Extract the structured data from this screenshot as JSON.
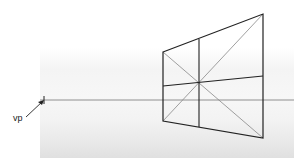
{
  "diagram": {
    "vanishing_point": {
      "label": "vp",
      "x": 44,
      "y": 100
    },
    "horizon_line": {
      "y": 100,
      "x1": 40,
      "x2": 294
    },
    "plane": {
      "top_left": [
        163,
        52
      ],
      "top_right": [
        263,
        14
      ],
      "bottom_right": [
        263,
        138
      ],
      "bottom_left": [
        163,
        121
      ],
      "center": [
        199,
        83
      ]
    },
    "colors": {
      "outline": "#222222",
      "diagonal": "#888888",
      "horizon": "#777777",
      "band": "#eeeeee"
    }
  }
}
